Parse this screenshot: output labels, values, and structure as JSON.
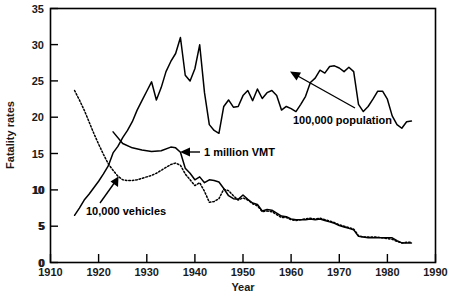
{
  "chart_data": {
    "type": "line",
    "title": "",
    "xlabel": "Year",
    "ylabel": "Fatality rates",
    "xlim": [
      1910,
      1990
    ],
    "ylim": [
      0,
      35
    ],
    "xticks": [
      1910,
      1920,
      1930,
      1940,
      1950,
      1960,
      1970,
      1980,
      1990
    ],
    "yticks": [
      0,
      5,
      10,
      15,
      20,
      25,
      30,
      35
    ],
    "grid": false,
    "legend_position": "inline-annotations",
    "annotations": [
      {
        "text": "100,000 population",
        "points_to_year": 1964,
        "points_to_value": 24.5
      },
      {
        "text": "1 million VMT",
        "points_to_year": 1937,
        "points_to_value": 15.4
      },
      {
        "text": "10,000 vehicles",
        "points_to_year": 1926,
        "points_to_value": 11.4
      }
    ],
    "series": [
      {
        "name": "100,000 population",
        "style": "solid",
        "x": [
          1915,
          1916,
          1917,
          1918,
          1919,
          1920,
          1921,
          1922,
          1923,
          1924,
          1925,
          1926,
          1927,
          1928,
          1929,
          1930,
          1931,
          1932,
          1933,
          1934,
          1935,
          1936,
          1937,
          1938,
          1939,
          1940,
          1941,
          1942,
          1943,
          1944,
          1945,
          1946,
          1947,
          1948,
          1949,
          1950,
          1951,
          1952,
          1953,
          1954,
          1955,
          1956,
          1957,
          1958,
          1959,
          1960,
          1961,
          1962,
          1963,
          1964,
          1965,
          1966,
          1967,
          1968,
          1969,
          1970,
          1971,
          1972,
          1973,
          1974,
          1975,
          1976,
          1977,
          1978,
          1979,
          1980,
          1981,
          1982,
          1983,
          1984,
          1985
        ],
        "y": [
          6.5,
          7.5,
          8.6,
          9.4,
          10.3,
          11.2,
          12.2,
          13.3,
          15.1,
          16.0,
          17.2,
          18.2,
          19.4,
          21.0,
          22.3,
          23.6,
          24.9,
          22.4,
          24.1,
          26.3,
          27.7,
          28.8,
          31.0,
          25.8,
          25.0,
          26.7,
          30.0,
          23.4,
          19.0,
          18.2,
          17.8,
          21.5,
          22.4,
          21.4,
          21.5,
          23.0,
          23.7,
          22.3,
          23.9,
          22.6,
          23.4,
          23.7,
          23.0,
          21.0,
          21.5,
          21.2,
          20.8,
          21.8,
          22.9,
          24.8,
          25.4,
          26.5,
          26.1,
          27.0,
          27.1,
          26.8,
          26.3,
          26.9,
          26.3,
          21.8,
          20.8,
          21.5,
          22.5,
          23.6,
          23.6,
          22.5,
          20.2,
          19.0,
          18.5,
          19.4,
          19.5
        ]
      },
      {
        "name": "1 million VMT",
        "style": "solid",
        "x": [
          1923,
          1925,
          1927,
          1929,
          1931,
          1933,
          1935,
          1936,
          1937,
          1938,
          1939,
          1940,
          1941,
          1942,
          1943,
          1944,
          1945,
          1946,
          1947,
          1948,
          1949,
          1950,
          1951,
          1952,
          1953,
          1954,
          1955,
          1956,
          1957,
          1958,
          1959,
          1960,
          1961,
          1962,
          1963,
          1964,
          1965,
          1966,
          1967,
          1968,
          1969,
          1970,
          1971,
          1972,
          1973,
          1974,
          1975,
          1976,
          1977,
          1978,
          1979,
          1980,
          1981,
          1982,
          1983,
          1984,
          1985
        ],
        "y": [
          18.0,
          16.4,
          15.8,
          15.5,
          15.3,
          15.4,
          15.9,
          15.8,
          15.2,
          13.0,
          12.3,
          11.4,
          11.8,
          11.0,
          11.4,
          11.3,
          11.1,
          10.2,
          9.2,
          8.8,
          8.7,
          9.3,
          8.7,
          8.2,
          8.0,
          7.1,
          7.3,
          7.2,
          6.8,
          6.4,
          6.3,
          6.0,
          5.9,
          5.9,
          5.9,
          6.0,
          5.9,
          6.0,
          5.8,
          5.6,
          5.4,
          5.1,
          4.9,
          4.7,
          4.5,
          3.6,
          3.5,
          3.4,
          3.4,
          3.4,
          3.4,
          3.4,
          3.4,
          3.0,
          2.7,
          2.7,
          2.7
        ]
      },
      {
        "name": "10,000 vehicles",
        "style": "dotted",
        "x": [
          1915,
          1916,
          1917,
          1918,
          1919,
          1920,
          1921,
          1922,
          1923,
          1924,
          1925,
          1926,
          1927,
          1928,
          1929,
          1930,
          1931,
          1932,
          1933,
          1934,
          1935,
          1936,
          1937,
          1938,
          1939,
          1940,
          1941,
          1942,
          1943,
          1944,
          1945,
          1946,
          1947,
          1948,
          1949,
          1950,
          1951,
          1952,
          1953,
          1954,
          1955,
          1956,
          1957,
          1958,
          1959,
          1960,
          1961,
          1962,
          1963,
          1964,
          1965,
          1966,
          1967,
          1968,
          1969,
          1970,
          1971,
          1972,
          1973,
          1974,
          1975,
          1976,
          1977,
          1978,
          1979,
          1980,
          1981,
          1982,
          1983,
          1984,
          1985
        ],
        "y": [
          23.7,
          22.4,
          21.0,
          19.4,
          17.8,
          16.3,
          14.9,
          13.6,
          12.7,
          11.9,
          11.4,
          11.3,
          11.3,
          11.4,
          11.6,
          11.8,
          12.0,
          12.3,
          12.7,
          13.1,
          13.5,
          13.7,
          13.4,
          12.2,
          11.4,
          10.6,
          11.0,
          9.8,
          8.3,
          8.4,
          8.8,
          10.1,
          9.9,
          9.2,
          8.6,
          8.9,
          8.6,
          8.1,
          7.8,
          7.0,
          7.1,
          7.0,
          6.6,
          6.2,
          6.2,
          5.9,
          5.8,
          5.9,
          6.0,
          6.1,
          6.0,
          6.1,
          5.9,
          5.7,
          5.5,
          5.2,
          5.0,
          4.8,
          4.6,
          3.7,
          3.5,
          3.5,
          3.5,
          3.5,
          3.4,
          3.3,
          3.2,
          2.9,
          2.7,
          2.8,
          2.8
        ]
      }
    ]
  },
  "axis": {
    "y_title": "Fatality rates",
    "x_title": "Year",
    "x_tick_labels": [
      "1910",
      "1920",
      "1930",
      "1940",
      "1950",
      "1960",
      "1970",
      "1980",
      "1990"
    ],
    "y_tick_labels": [
      "0",
      "5",
      "10",
      "15",
      "20",
      "25",
      "30",
      "35"
    ]
  },
  "labels": {
    "population": "100,000 population",
    "vmt": "1 million VMT",
    "vehicles": "10,000 vehicles"
  },
  "colors": {
    "ink": "#000000",
    "background": "#ffffff"
  }
}
